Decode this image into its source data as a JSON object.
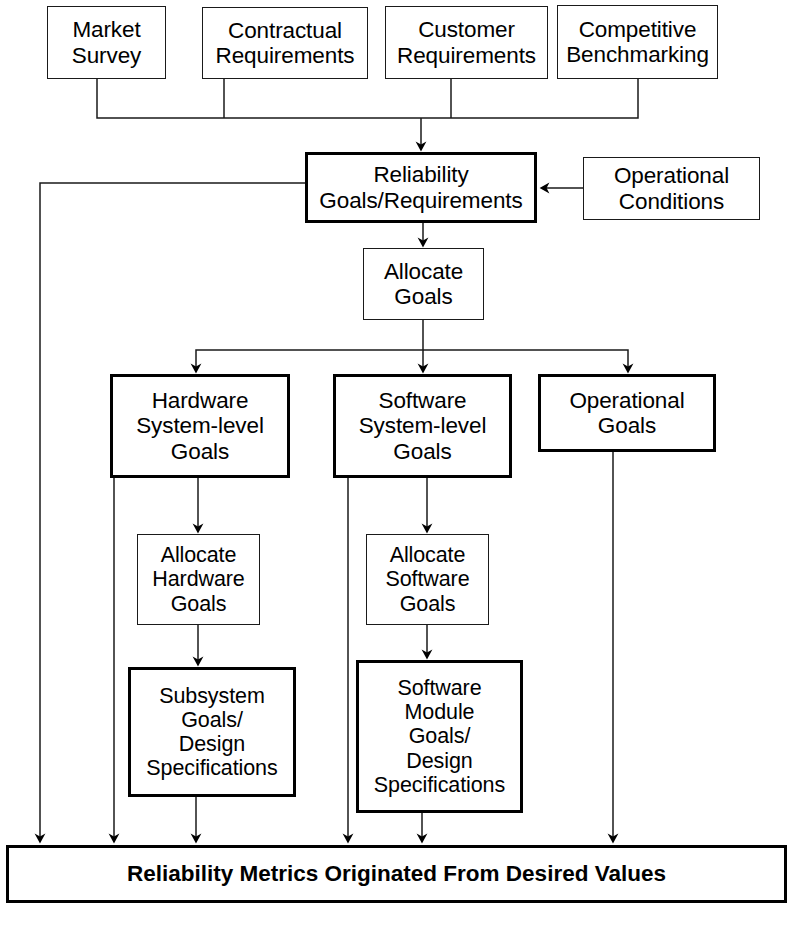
{
  "diagram": {
    "canvas": {
      "width": 792,
      "height": 925,
      "background": "#ffffff"
    },
    "stroke_color": "#000000",
    "nodes": [
      {
        "id": "market-survey",
        "label": "Market\nSurvey",
        "x": 47,
        "y": 6,
        "w": 119,
        "h": 73,
        "weight": "thin",
        "font": "f22"
      },
      {
        "id": "contractual-requirements",
        "label": "Contractual\nRequirements",
        "x": 202,
        "y": 7,
        "w": 166,
        "h": 72,
        "weight": "thin",
        "font": "f22"
      },
      {
        "id": "customer-requirements",
        "label": "Customer\nRequirements",
        "x": 385,
        "y": 6,
        "w": 163,
        "h": 73,
        "weight": "thin",
        "font": "f22"
      },
      {
        "id": "competitive-benchmarking",
        "label": "Competitive\nBenchmarking",
        "x": 557,
        "y": 5,
        "w": 161,
        "h": 74,
        "weight": "thin",
        "font": "f22"
      },
      {
        "id": "reliability-goals",
        "label": "Reliability\nGoals/Requirements",
        "x": 305,
        "y": 152,
        "w": 232,
        "h": 71,
        "weight": "thick",
        "font": "f22"
      },
      {
        "id": "operational-conditions",
        "label": "Operational\nConditions",
        "x": 583,
        "y": 157,
        "w": 177,
        "h": 63,
        "weight": "thin",
        "font": "f22"
      },
      {
        "id": "allocate-goals",
        "label": "Allocate\nGoals",
        "x": 363,
        "y": 248,
        "w": 121,
        "h": 72,
        "weight": "thin",
        "font": "f22"
      },
      {
        "id": "hardware-system-goals",
        "label": "Hardware\nSystem-level\nGoals",
        "x": 110,
        "y": 374,
        "w": 180,
        "h": 104,
        "weight": "thick",
        "font": "f22"
      },
      {
        "id": "software-system-goals",
        "label": "Software\nSystem-level\nGoals",
        "x": 333,
        "y": 374,
        "w": 179,
        "h": 104,
        "weight": "thick",
        "font": "f22"
      },
      {
        "id": "operational-goals",
        "label": "Operational\nGoals",
        "x": 538,
        "y": 374,
        "w": 178,
        "h": 78,
        "weight": "thick",
        "font": "f22"
      },
      {
        "id": "allocate-hardware-goals",
        "label": "Allocate\nHardware\nGoals",
        "x": 137,
        "y": 534,
        "w": 123,
        "h": 91,
        "weight": "thin",
        "font": "f21"
      },
      {
        "id": "allocate-software-goals",
        "label": "Allocate\nSoftware\nGoals",
        "x": 366,
        "y": 534,
        "w": 123,
        "h": 91,
        "weight": "thin",
        "font": "f21"
      },
      {
        "id": "subsystem-goals-design",
        "label": "Subsystem\nGoals/\nDesign\nSpecifications",
        "x": 128,
        "y": 667,
        "w": 168,
        "h": 130,
        "weight": "thick",
        "font": "f21"
      },
      {
        "id": "software-module-goals",
        "label": "Software\nModule\nGoals/\nDesign\nSpecifications",
        "x": 356,
        "y": 660,
        "w": 167,
        "h": 153,
        "weight": "thick",
        "font": "f21"
      },
      {
        "id": "reliability-metrics",
        "label": "Reliability Metrics Originated From Desired Values",
        "x": 6,
        "y": 845,
        "w": 781,
        "h": 58,
        "weight": "thick",
        "font": "f22b"
      }
    ],
    "edges": [
      {
        "id": "market-survey-to-bus",
        "from": "market-survey",
        "to": "input-bus",
        "arrow": false
      },
      {
        "id": "contractual-to-bus",
        "from": "contractual-requirements",
        "to": "input-bus",
        "arrow": false
      },
      {
        "id": "customer-to-bus",
        "from": "customer-requirements",
        "to": "input-bus",
        "arrow": false
      },
      {
        "id": "competitive-to-bus",
        "from": "competitive-benchmarking",
        "to": "input-bus",
        "arrow": false
      },
      {
        "id": "bus-to-reliability-goals",
        "from": "input-bus",
        "to": "reliability-goals",
        "arrow": true
      },
      {
        "id": "operational-conditions-to-goals",
        "from": "operational-conditions",
        "to": "reliability-goals",
        "arrow": true
      },
      {
        "id": "reliability-goals-to-allocate",
        "from": "reliability-goals",
        "to": "allocate-goals",
        "arrow": true
      },
      {
        "id": "reliability-goals-to-metrics",
        "from": "reliability-goals",
        "to": "reliability-metrics",
        "arrow": true
      },
      {
        "id": "allocate-goals-to-hardware",
        "from": "allocate-goals",
        "to": "hardware-system-goals",
        "arrow": true
      },
      {
        "id": "allocate-goals-to-software",
        "from": "allocate-goals",
        "to": "software-system-goals",
        "arrow": true
      },
      {
        "id": "allocate-goals-to-operational",
        "from": "allocate-goals",
        "to": "operational-goals",
        "arrow": true
      },
      {
        "id": "hardware-to-allocate-hardware",
        "from": "hardware-system-goals",
        "to": "allocate-hardware-goals",
        "arrow": true
      },
      {
        "id": "hardware-to-metrics",
        "from": "hardware-system-goals",
        "to": "reliability-metrics",
        "arrow": true
      },
      {
        "id": "software-to-allocate-software",
        "from": "software-system-goals",
        "to": "allocate-software-goals",
        "arrow": true
      },
      {
        "id": "software-to-metrics",
        "from": "software-system-goals",
        "to": "reliability-metrics",
        "arrow": true
      },
      {
        "id": "operational-goals-to-metrics",
        "from": "operational-goals",
        "to": "reliability-metrics",
        "arrow": true
      },
      {
        "id": "allocate-hardware-to-subsystem",
        "from": "allocate-hardware-goals",
        "to": "subsystem-goals-design",
        "arrow": true
      },
      {
        "id": "allocate-software-to-module",
        "from": "allocate-software-goals",
        "to": "software-module-goals",
        "arrow": true
      },
      {
        "id": "subsystem-to-metrics",
        "from": "subsystem-goals-design",
        "to": "reliability-metrics",
        "arrow": true
      },
      {
        "id": "software-module-to-metrics",
        "from": "software-module-goals",
        "to": "reliability-metrics",
        "arrow": true
      }
    ]
  }
}
